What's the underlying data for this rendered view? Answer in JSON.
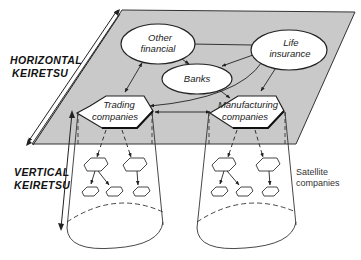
{
  "diagram": {
    "colors": {
      "plane_fill": "#c9c9c9",
      "plane_stroke": "#333333",
      "node_fill": "#ffffff",
      "line": "#222222",
      "background": "#ffffff"
    },
    "labels": {
      "horizontal": [
        "HORIZONTAL",
        "KEIRETSU"
      ],
      "vertical": [
        "VERTICAL",
        "KEIRETSU"
      ],
      "satellite": [
        "Satellite",
        "companies"
      ]
    },
    "nodes": {
      "other_financial": {
        "shape": "ellipse",
        "lines": [
          "Other",
          "financial"
        ]
      },
      "life_insurance": {
        "shape": "ellipse",
        "lines": [
          "Life",
          "insurance"
        ]
      },
      "banks": {
        "shape": "ellipse",
        "lines": [
          "Banks"
        ]
      },
      "trading_companies": {
        "shape": "hexagon",
        "lines": [
          "Trading",
          "companies"
        ]
      },
      "manufacturing_companies": {
        "shape": "hexagon",
        "lines": [
          "Manufacturing",
          "companies"
        ]
      }
    },
    "edges": [
      {
        "from": "life_insurance",
        "to": "other_financial",
        "type": "arrow"
      },
      {
        "from": "life_insurance",
        "to": "banks",
        "type": "arrow"
      },
      {
        "from": "life_insurance",
        "to": "manufacturing_companies",
        "type": "arrow"
      },
      {
        "from": "life_insurance",
        "to": "trading_companies",
        "type": "arrow"
      },
      {
        "from": "other_financial",
        "to": "banks",
        "type": "double-arrow"
      },
      {
        "from": "other_financial",
        "to": "trading_companies",
        "type": "double-arrow"
      },
      {
        "from": "banks",
        "to": "manufacturing_companies",
        "type": "arrow"
      },
      {
        "from": "trading_companies",
        "to": "manufacturing_companies",
        "type": "double-arrow"
      }
    ],
    "groups": [
      {
        "parent": "trading_companies",
        "tier1": 2,
        "tier2": 3
      },
      {
        "parent": "manufacturing_companies",
        "tier1": 2,
        "tier2": 3
      }
    ]
  }
}
